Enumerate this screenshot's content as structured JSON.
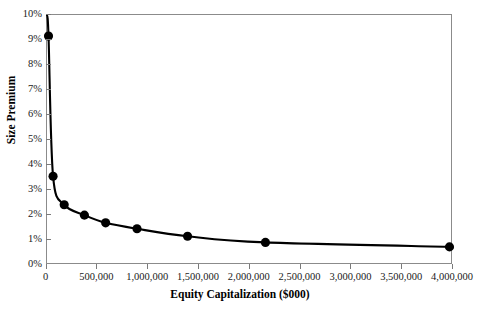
{
  "chart_data": {
    "type": "line",
    "title": "",
    "xlabel": "Equity Capitalization ($000)",
    "ylabel": "Size Premium",
    "xlim": [
      0,
      4000000
    ],
    "ylim": [
      0,
      0.1
    ],
    "grid": false,
    "legend": "none",
    "marker": "filled-circle",
    "line_color": "#000000",
    "marker_color": "#000000",
    "frame_color": "#8b8b8b",
    "x_tick_labels": [
      "0",
      "500,000",
      "1,000,000",
      "1,500,000",
      "2,000,000",
      "2,500,000",
      "3,000,000",
      "3,500,000",
      "4,000,000"
    ],
    "x_tick_values": [
      0,
      500000,
      1000000,
      1500000,
      2000000,
      2500000,
      3000000,
      3500000,
      4000000
    ],
    "y_tick_labels": [
      "0%",
      "1%",
      "2%",
      "3%",
      "4%",
      "5%",
      "6%",
      "7%",
      "8%",
      "9%",
      "10%"
    ],
    "y_tick_values": [
      0,
      1,
      2,
      3,
      4,
      5,
      6,
      7,
      8,
      9,
      10
    ],
    "series": [
      {
        "name": "Size Premium",
        "points": [
          {
            "x": 15000,
            "y": 9.15,
            "label": "9.15%"
          },
          {
            "x": 60000,
            "y": 3.5,
            "label": "3.50%"
          },
          {
            "x": 170000,
            "y": 2.35,
            "label": "2.35%"
          },
          {
            "x": 370000,
            "y": 1.93,
            "label": "1.93%"
          },
          {
            "x": 580000,
            "y": 1.62,
            "label": "1.62%"
          },
          {
            "x": 890000,
            "y": 1.38,
            "label": "1.38%"
          },
          {
            "x": 1390000,
            "y": 1.08,
            "label": "1.08%"
          },
          {
            "x": 2160000,
            "y": 0.83,
            "label": "0.83%"
          },
          {
            "x": 3980000,
            "y": 0.65,
            "label": "0.65%"
          }
        ]
      }
    ]
  }
}
